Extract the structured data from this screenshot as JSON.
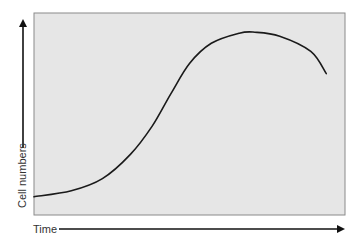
{
  "chart_data": {
    "type": "line",
    "title": "",
    "xlabel": "Time",
    "ylabel": "Cell numbers",
    "grid": false,
    "legend": null,
    "ticks": false,
    "x": [
      0,
      0.12,
      0.22,
      0.31,
      0.38,
      0.44,
      0.5,
      0.57,
      0.66,
      0.71,
      0.79,
      0.89,
      0.94
    ],
    "series": [
      {
        "name": "Cell numbers",
        "values": [
          0.09,
          0.12,
          0.18,
          0.3,
          0.44,
          0.6,
          0.75,
          0.85,
          0.9,
          0.905,
          0.885,
          0.81,
          0.7
        ]
      }
    ],
    "xlim": [
      0,
      1
    ],
    "ylim": [
      0,
      1
    ],
    "colors": {
      "plot_background": "#e6e6e6",
      "plot_border": "#8a8a8a",
      "curve": "#1a1a1a",
      "arrow": "#111111"
    }
  }
}
